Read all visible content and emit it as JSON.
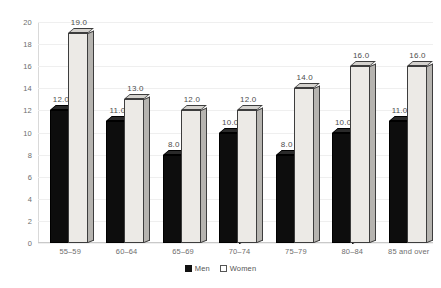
{
  "chart_data": {
    "type": "bar",
    "title": "",
    "subtitle": "",
    "xlabel": "",
    "ylabel": "",
    "ylim": [
      0,
      20
    ],
    "ytick_step": 2,
    "yticks": [
      "20",
      "18",
      "16",
      "14",
      "12",
      "10",
      "8",
      "6",
      "4",
      "2",
      "0"
    ],
    "grid": true,
    "grid_axis": "y",
    "legend_position": "bottom-center",
    "style": "3d-clustered-column",
    "categories": [
      "55–59",
      "60–64",
      "65–69",
      "70–74",
      "75–79",
      "80–84",
      "85 and over"
    ],
    "series": [
      {
        "name": "Men",
        "color": "#0d0d0d",
        "values": [
          12.0,
          11.0,
          8.0,
          10.0,
          8.0,
          10.0,
          11.0
        ],
        "labels": [
          "12.0",
          "11.0",
          "8.0",
          "10.0",
          "8.0",
          "10.0",
          "11.0"
        ]
      },
      {
        "name": "Women",
        "color": "#eceae6",
        "values": [
          19.0,
          13.0,
          12.0,
          12.0,
          14.0,
          16.0,
          16.0
        ],
        "labels": [
          "19.0",
          "13.0",
          "12.0",
          "12.0",
          "14.0",
          "16.0",
          "16.0"
        ]
      }
    ]
  },
  "legend": {
    "items": [
      {
        "label": "Men",
        "swatch": "filled-square"
      },
      {
        "label": "Women",
        "swatch": "open-square"
      }
    ]
  },
  "colors": {
    "men_bar": "#0d0d0d",
    "women_bar": "#eceae6",
    "gridline": "#efefef",
    "axis": "#c9c9c9",
    "text": "#6e6e6e"
  }
}
